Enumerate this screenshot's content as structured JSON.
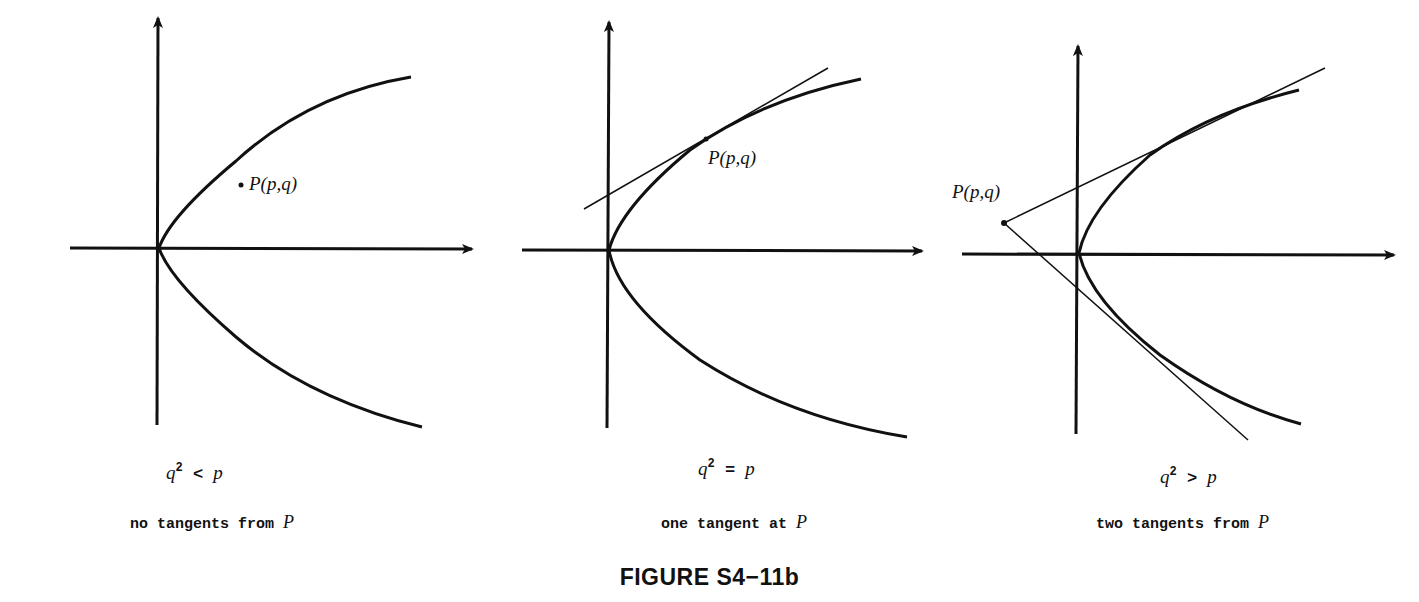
{
  "figure": {
    "caption": "FIGURE S4−11b",
    "panels": [
      {
        "id": "panel-1",
        "point_label": "P(p,q)",
        "condition_lhs": "q",
        "condition_exp": "2",
        "condition_op": " < ",
        "condition_rhs": "p",
        "description_text": "no tangents from ",
        "description_var": "P",
        "tangent_count": 0
      },
      {
        "id": "panel-2",
        "point_label": "P(p,q)",
        "condition_lhs": "q",
        "condition_exp": "2",
        "condition_op": " = ",
        "condition_rhs": "p",
        "description_text": "one tangent at ",
        "description_var": "P",
        "tangent_count": 1
      },
      {
        "id": "panel-3",
        "point_label": "P(p,q)",
        "condition_lhs": "q",
        "condition_exp": "2",
        "condition_op": " > ",
        "condition_rhs": "p",
        "description_text": "two tangents from ",
        "description_var": "P",
        "tangent_count": 2
      }
    ],
    "curve": "parabola x = y^2 opening right",
    "colors": {
      "ink": "#111111",
      "background": "#ffffff"
    }
  }
}
